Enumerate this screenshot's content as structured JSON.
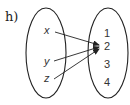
{
  "problem_label": "h)",
  "domain_set": {
    "elements": [
      "x",
      "y",
      "z"
    ]
  },
  "codomain_set": {
    "elements": [
      "1",
      "2",
      "3",
      "4"
    ]
  },
  "mappings": [
    {
      "from": "x",
      "to": "2"
    },
    {
      "from": "y",
      "to": "2"
    },
    {
      "from": "z",
      "to": "2"
    }
  ],
  "colors": {
    "stroke": "#222222",
    "text": "#333333"
  }
}
